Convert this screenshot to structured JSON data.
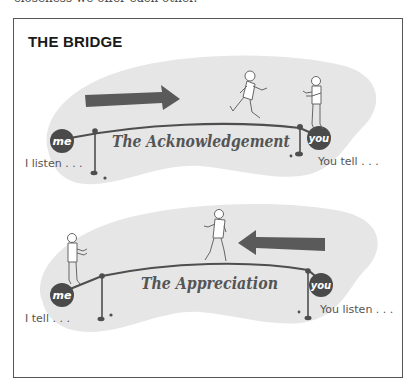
{
  "page": {
    "top_text_partial": "closeness we offer each other."
  },
  "figure": {
    "title": "THE BRIDGE",
    "colors": {
      "blob": "#e6e6e6",
      "ink": "#555555",
      "circle": "#4a4a4a",
      "arrow": "#5a5a5a"
    },
    "bridges": [
      {
        "name": "The Acknowledgement",
        "left_circle": "me",
        "right_circle": "you",
        "left_caption": "I listen . . .",
        "right_caption": "You tell . . .",
        "arrow_direction": "right",
        "walker_direction": "right"
      },
      {
        "name": "The Appreciation",
        "left_circle": "me",
        "right_circle": "you",
        "left_caption": "I tell . . .",
        "right_caption": "You listen . . .",
        "arrow_direction": "left",
        "walker_direction": "left"
      }
    ]
  }
}
